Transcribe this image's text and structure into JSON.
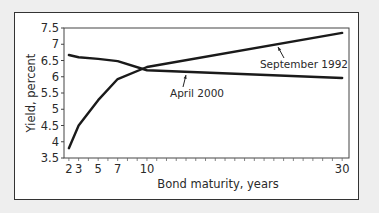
{
  "chart_data": {
    "type": "line",
    "title": "",
    "xlabel": "Bond maturity, years",
    "ylabel": "Yield, percent",
    "xlim": [
      1.5,
      30.7
    ],
    "ylim": [
      3.5,
      7.5
    ],
    "x_ticks": [
      2,
      3,
      5,
      7,
      10,
      30
    ],
    "x_tick_labels": [
      "2",
      "3",
      "5",
      "7",
      "10",
      "30"
    ],
    "x_minor_ticks_every": 1,
    "y_ticks": [
      3.5,
      4,
      4.5,
      5,
      5.5,
      6,
      6.5,
      7,
      7.5
    ],
    "y_tick_labels": [
      "3.5",
      "4",
      "4.5",
      "5",
      "5.5",
      "6",
      "6.5",
      "7",
      "7.5"
    ],
    "grid": false,
    "legend": "none (inline annotations)",
    "x": [
      2,
      3,
      5,
      7,
      10,
      30
    ],
    "series": [
      {
        "name": "September 1992",
        "values": [
          3.8,
          4.5,
          5.28,
          5.93,
          6.3,
          7.35
        ],
        "annotation": "September 1992"
      },
      {
        "name": "April 2000",
        "values": [
          6.67,
          6.6,
          6.55,
          6.48,
          6.2,
          5.96
        ],
        "annotation": "April 2000"
      }
    ],
    "line_color": "#1a1a1a"
  }
}
